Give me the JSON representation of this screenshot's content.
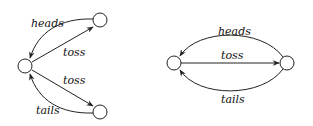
{
  "diagrams": [
    {
      "name": "branching-diagram",
      "edges": [
        {
          "label": "heads",
          "from": "top-right",
          "to": "center"
        },
        {
          "label": "toss",
          "from": "center",
          "to": "top-right"
        },
        {
          "label": "toss",
          "from": "center",
          "to": "bottom-right"
        },
        {
          "label": "tails",
          "from": "bottom-right",
          "to": "center"
        }
      ]
    },
    {
      "name": "two-node-diagram",
      "edges": [
        {
          "label": "heads",
          "from": "right",
          "to": "left"
        },
        {
          "label": "toss",
          "from": "left",
          "to": "right"
        },
        {
          "label": "tails",
          "from": "right",
          "to": "left"
        }
      ]
    }
  ]
}
